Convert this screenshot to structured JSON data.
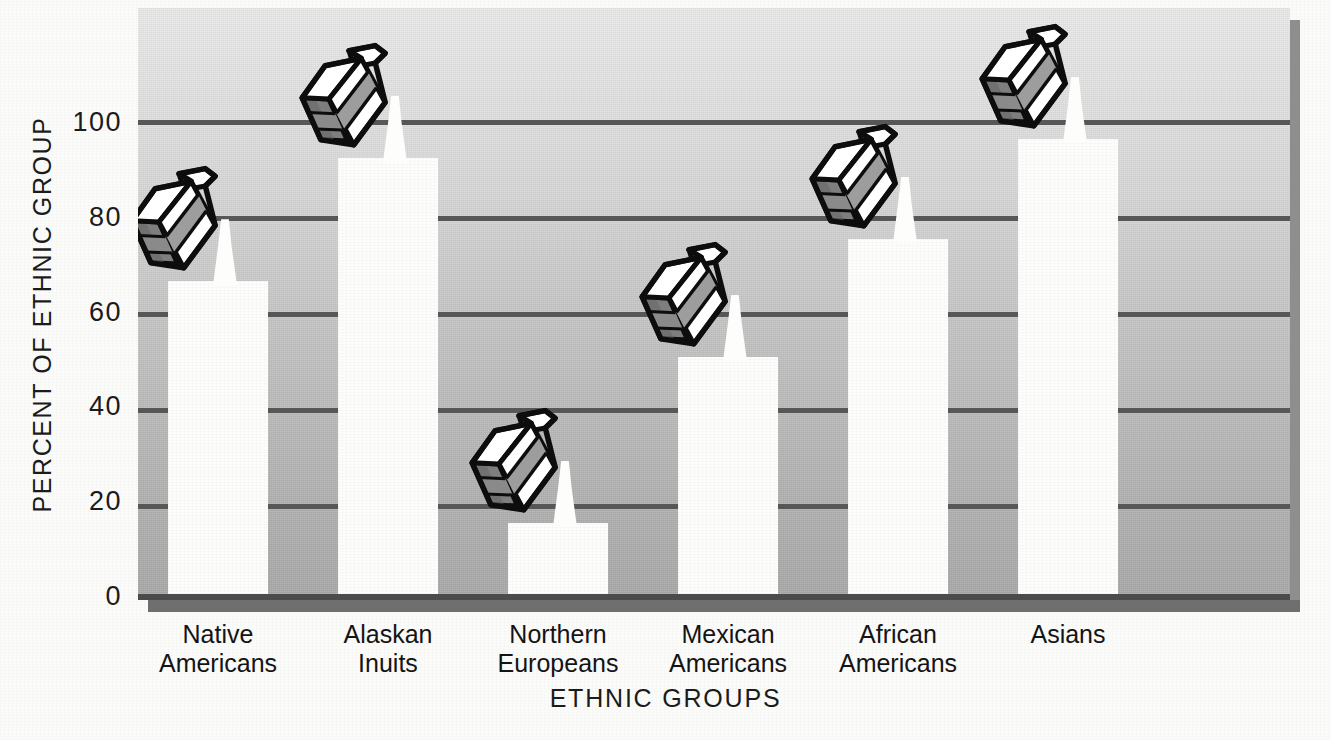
{
  "chart_data": {
    "type": "bar",
    "title": "",
    "xlabel": "ETHNIC GROUPS",
    "ylabel": "PERCENT OF ETHNIC GROUP",
    "categories": [
      "Native Americans",
      "Alaskan Inuits",
      "Northern Europeans",
      "Mexican Americans",
      "African Americans",
      "Asians"
    ],
    "category_lines": [
      [
        "Native",
        "Americans"
      ],
      [
        "Alaskan",
        "Inuits"
      ],
      [
        "Northern",
        "Europeans"
      ],
      [
        "Mexican",
        "Americans"
      ],
      [
        "African",
        "Americans"
      ],
      [
        "Asians"
      ]
    ],
    "values": [
      66,
      92,
      15,
      50,
      75,
      96
    ],
    "ylim": [
      0,
      110
    ],
    "yticks": [
      0,
      20,
      40,
      60,
      80,
      100
    ],
    "ytick_labels": [
      "0",
      "20",
      "40",
      "60",
      "80",
      "100"
    ],
    "grid": true,
    "legend": "none",
    "bar_color": "#fdfdfc",
    "grid_color": "#575757",
    "marker_icon": "milk-carton-icon",
    "annotation": "A tilted milk carton pours a stream of milk onto the top of each bar."
  },
  "colors": {
    "background": "#fbfbfa",
    "plot_top": "#eaeaea",
    "plot_bottom": "#a9a9a9",
    "gridline": "#575757",
    "bar": "#fdfdfc",
    "shadow": "#8e8e8e",
    "text": "#1b1b1b",
    "carton_band": "#9a9a9a",
    "carton_side": "#808080",
    "carton_outline": "#0d0d0d"
  }
}
